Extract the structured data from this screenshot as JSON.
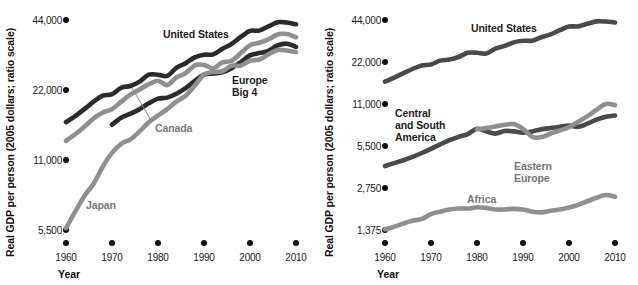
{
  "figure": {
    "axis_title_y": "Real GDP per person (2005 dollars; ratio scale)",
    "axis_title_x": "Year"
  },
  "colors": {
    "dark": "#2b2b2b",
    "mid_dark": "#4a4a4a",
    "gray": "#8f8f8f",
    "light_gray": "#a8a8a8",
    "text": "#1a1a1a"
  },
  "chart_data": [
    {
      "type": "line",
      "panel": "left",
      "title": "",
      "xlabel": "Year",
      "ylabel": "Real GDP per person (2005 dollars; ratio scale)",
      "scale": "log2",
      "grid": false,
      "legend_position": "inline-annotations",
      "xlim": [
        1960,
        2010
      ],
      "ylim": [
        5500,
        44000
      ],
      "xticks": [
        1960,
        1970,
        1980,
        1990,
        2000,
        2010
      ],
      "xtick_labels": [
        "1960",
        "1970",
        "1980",
        "1990",
        "2000",
        "2010"
      ],
      "yticks": [
        5500,
        11000,
        22000,
        44000
      ],
      "ytick_labels": [
        "5,500",
        "11,000",
        "22,000",
        "44,000"
      ],
      "series": [
        {
          "name": "United States",
          "color": "#2b2b2b",
          "x": [
            1960,
            1962,
            1964,
            1966,
            1968,
            1970,
            1972,
            1974,
            1976,
            1978,
            1980,
            1982,
            1984,
            1986,
            1988,
            1990,
            1992,
            1994,
            1996,
            1998,
            2000,
            2002,
            2004,
            2006,
            2008,
            2010
          ],
          "values": [
            16000,
            17000,
            18200,
            19600,
            20800,
            21100,
            22500,
            22900,
            23900,
            25600,
            25600,
            25300,
            27400,
            28700,
            30400,
            31200,
            31300,
            33100,
            34700,
            37200,
            39500,
            39600,
            41300,
            43000,
            42900,
            42200
          ]
        },
        {
          "name": "Canada",
          "color": "#8f8f8f",
          "x": [
            1960,
            1962,
            1964,
            1966,
            1968,
            1970,
            1972,
            1974,
            1976,
            1978,
            1980,
            1982,
            1984,
            1986,
            1988,
            1990,
            1992,
            1994,
            1996,
            1998,
            2000,
            2002,
            2004,
            2006,
            2008,
            2010
          ],
          "values": [
            13300,
            14200,
            15300,
            16600,
            17600,
            18200,
            19600,
            21000,
            22100,
            23300,
            24100,
            23100,
            24900,
            26000,
            28100,
            28200,
            27300,
            28900,
            29400,
            31700,
            34300,
            35100,
            36300,
            38100,
            38300,
            37100
          ]
        },
        {
          "name": "Europe Big 4",
          "color": "#2b2b2b",
          "x": [
            1970,
            1972,
            1974,
            1976,
            1978,
            1980,
            1982,
            1984,
            1986,
            1988,
            1990,
            1992,
            1994,
            1996,
            1998,
            2000,
            2002,
            2004,
            2006,
            2008,
            2010
          ],
          "values": [
            15600,
            16700,
            17400,
            18200,
            19300,
            20200,
            20400,
            21200,
            22400,
            24100,
            25600,
            25900,
            26200,
            27300,
            29000,
            31000,
            31700,
            32400,
            34200,
            34800,
            33700
          ]
        },
        {
          "name": "Japan",
          "color": "#8f8f8f",
          "x": [
            1960,
            1962,
            1964,
            1966,
            1968,
            1970,
            1972,
            1974,
            1976,
            1978,
            1980,
            1982,
            1984,
            1986,
            1988,
            1990,
            1992,
            1994,
            1996,
            1998,
            2000,
            2002,
            2004,
            2006,
            2008,
            2010
          ],
          "values": [
            5600,
            6600,
            7700,
            8700,
            10300,
            11800,
            12900,
            13500,
            14600,
            16000,
            17100,
            18200,
            19600,
            20800,
            23000,
            25600,
            26300,
            26500,
            28000,
            28000,
            29400,
            29700,
            31300,
            32700,
            32500,
            32000
          ]
        }
      ],
      "annotations": [
        {
          "text": "United States",
          "series": "United States"
        },
        {
          "text": "Europe\nBig 4",
          "series": "Europe Big 4"
        },
        {
          "text": "Canada",
          "series": "Canada"
        },
        {
          "text": "Japan",
          "series": "Japan"
        }
      ]
    },
    {
      "type": "line",
      "panel": "right",
      "title": "",
      "xlabel": "Year",
      "ylabel": "Real GDP per person (2005 dollars; ratio scale)",
      "scale": "log2",
      "grid": false,
      "legend_position": "inline-annotations",
      "xlim": [
        1960,
        2010
      ],
      "ylim": [
        1375,
        44000
      ],
      "xticks": [
        1960,
        1970,
        1980,
        1990,
        2000,
        2010
      ],
      "xtick_labels": [
        "1960",
        "1970",
        "1980",
        "1990",
        "2000",
        "2010"
      ],
      "yticks": [
        1375,
        2750,
        5500,
        11000,
        22000,
        44000
      ],
      "ytick_labels": [
        "1,375",
        "2,750",
        "5,500",
        "11,000",
        "22,000",
        "44,000"
      ],
      "series": [
        {
          "name": "United States",
          "color": "#4a4a4a",
          "x": [
            1960,
            1962,
            1964,
            1966,
            1968,
            1970,
            1972,
            1974,
            1976,
            1978,
            1980,
            1982,
            1984,
            1986,
            1988,
            1990,
            1992,
            1994,
            1996,
            1998,
            2000,
            2002,
            2004,
            2006,
            2008,
            2010
          ],
          "values": [
            15900,
            17000,
            18300,
            19600,
            20800,
            21100,
            22500,
            22900,
            23900,
            25600,
            25600,
            25300,
            27400,
            28700,
            30400,
            31200,
            31300,
            33100,
            34700,
            37200,
            39500,
            39600,
            41300,
            43000,
            42900,
            42200
          ]
        },
        {
          "name": "Central and South America",
          "color": "#4a4a4a",
          "x": [
            1960,
            1962,
            1964,
            1966,
            1968,
            1970,
            1972,
            1974,
            1976,
            1978,
            1980,
            1982,
            1984,
            1986,
            1988,
            1990,
            1992,
            1994,
            1996,
            1998,
            2000,
            2002,
            2004,
            2006,
            2008,
            2010
          ],
          "values": [
            3950,
            4150,
            4350,
            4600,
            4900,
            5250,
            5650,
            6050,
            6400,
            6700,
            7300,
            7000,
            6750,
            7050,
            7000,
            6850,
            7000,
            7250,
            7400,
            7550,
            7700,
            7550,
            7950,
            8500,
            8900,
            9100
          ]
        },
        {
          "name": "Eastern Europe",
          "color": "#8f8f8f",
          "x": [
            1980,
            1982,
            1984,
            1986,
            1988,
            1990,
            1992,
            1994,
            1996,
            1998,
            2000,
            2002,
            2004,
            2006,
            2008,
            2010
          ],
          "values": [
            7250,
            7400,
            7600,
            7800,
            7900,
            7300,
            6400,
            6350,
            6750,
            7100,
            7500,
            8200,
            9000,
            10000,
            11000,
            10800
          ]
        },
        {
          "name": "Africa",
          "color": "#8f8f8f",
          "x": [
            1960,
            1962,
            1964,
            1966,
            1968,
            1970,
            1972,
            1974,
            1976,
            1978,
            1980,
            1982,
            1984,
            1986,
            1988,
            1990,
            1992,
            1994,
            1996,
            1998,
            2000,
            2002,
            2004,
            2006,
            2008,
            2010
          ],
          "values": [
            1390,
            1450,
            1530,
            1600,
            1650,
            1790,
            1860,
            1930,
            1960,
            1960,
            2000,
            1980,
            1930,
            1930,
            1950,
            1930,
            1860,
            1840,
            1890,
            1930,
            1990,
            2080,
            2210,
            2340,
            2450,
            2380
          ]
        }
      ],
      "annotations": [
        {
          "text": "United States",
          "series": "United States"
        },
        {
          "text": "Central\nand South\nAmerica",
          "series": "Central and South America"
        },
        {
          "text": "Eastern\nEurope",
          "series": "Eastern Europe"
        },
        {
          "text": "Africa",
          "series": "Africa"
        }
      ]
    }
  ]
}
